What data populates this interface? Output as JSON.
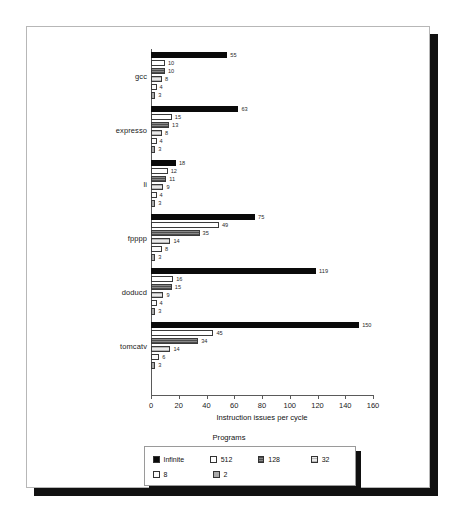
{
  "chart_data": {
    "type": "bar",
    "orientation": "horizontal",
    "title": "",
    "xlabel": "Instruction issues per cycle",
    "ylabel": "",
    "xlim": [
      0,
      160
    ],
    "xticks": [
      0,
      20,
      40,
      60,
      80,
      100,
      120,
      140,
      160
    ],
    "grid": false,
    "legend_title": "Programs",
    "legend_position": "bottom-center",
    "categories": [
      "gcc",
      "expresso",
      "li",
      "fpppp",
      "doducd",
      "tomcatv"
    ],
    "series": [
      {
        "name": "Infinite",
        "color": "#0a0a0a",
        "values": [
          55,
          63,
          18,
          75,
          119,
          150
        ]
      },
      {
        "name": "512",
        "color": "#ffffff",
        "values": [
          10,
          15,
          12,
          49,
          16,
          45
        ]
      },
      {
        "name": "128",
        "color": "#6e6e6e",
        "values": [
          10,
          13,
          11,
          35,
          15,
          34
        ]
      },
      {
        "name": "32",
        "color": "#e9e9e9",
        "values": [
          8,
          8,
          9,
          14,
          9,
          14
        ]
      },
      {
        "name": "8",
        "color": "#fbfbfb",
        "values": [
          4,
          4,
          4,
          8,
          4,
          6
        ]
      },
      {
        "name": "2",
        "color": "#a9a9a9",
        "values": [
          3,
          3,
          3,
          3,
          3,
          3
        ]
      }
    ]
  },
  "legend": {
    "title": "Programs",
    "entries": [
      {
        "label": "Infinite",
        "swatch": "s-infinite"
      },
      {
        "label": "512",
        "swatch": "s-512"
      },
      {
        "label": "128",
        "swatch": "s-128"
      },
      {
        "label": "32",
        "swatch": "s-32"
      },
      {
        "label": "8",
        "swatch": "s-8"
      },
      {
        "label": "2",
        "swatch": "s-2"
      }
    ]
  }
}
